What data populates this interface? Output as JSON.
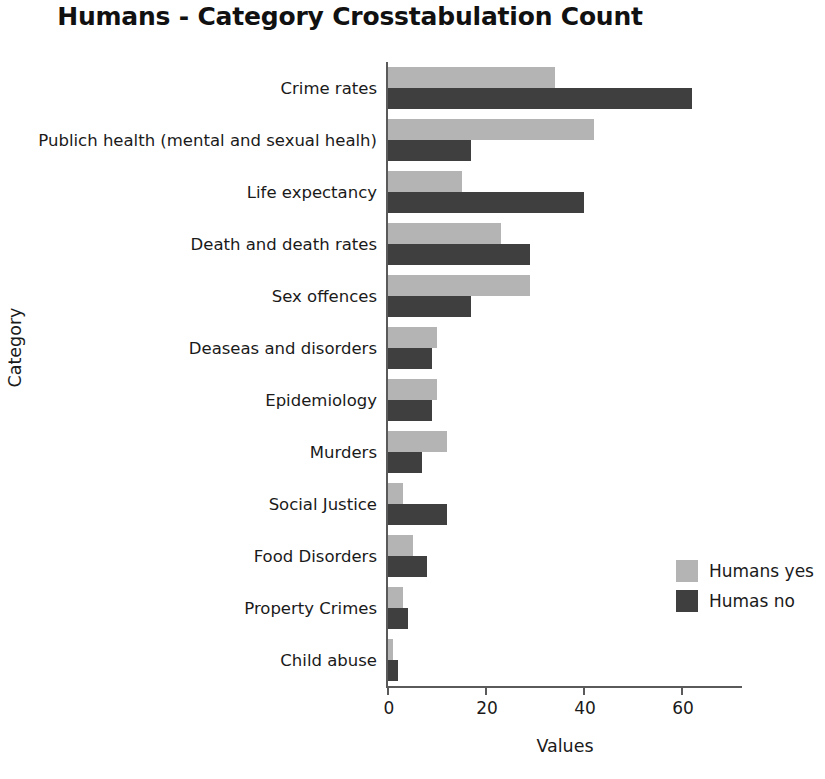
{
  "chart_data": {
    "type": "bar",
    "orientation": "horizontal",
    "title_bold": "Humans",
    "title_rest": " - Category Crosstabulation Count",
    "title": "Humans - Category Crosstabulation Count",
    "xlabel": "Values",
    "ylabel": "Category",
    "xlim": [
      0,
      72
    ],
    "xticks": [
      0,
      20,
      40,
      60
    ],
    "xtick_labels": [
      "0",
      "20",
      "40",
      "60"
    ],
    "grid": false,
    "legend_position": "center right",
    "categories": [
      "Crime rates",
      "Publich health (mental and sexual healh)",
      "Life expectancy",
      "Death and death rates",
      "Sex offences",
      "Deaseas and disorders",
      "Epidemiology",
      "Murders",
      "Social Justice",
      "Food Disorders",
      "Property Crimes",
      "Child abuse"
    ],
    "series": [
      {
        "name": "Humans yes",
        "color": "#b4b4b4",
        "values": [
          34,
          42,
          15,
          23,
          29,
          10,
          10,
          12,
          3,
          5,
          3,
          1
        ]
      },
      {
        "name": "Humas no",
        "color": "#3f3f3f",
        "values": [
          62,
          17,
          40,
          29,
          17,
          9,
          9,
          7,
          12,
          8,
          4,
          2
        ]
      }
    ]
  }
}
